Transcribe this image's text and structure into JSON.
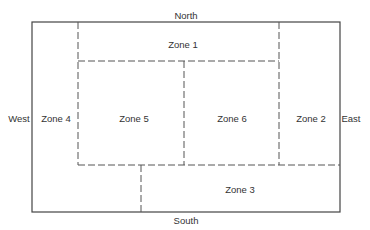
{
  "diagram": {
    "compass": {
      "north": "North",
      "south": "South",
      "east": "East",
      "west": "West"
    },
    "zones": [
      {
        "id": 1,
        "label": "Zone 1"
      },
      {
        "id": 2,
        "label": "Zone 2"
      },
      {
        "id": 3,
        "label": "Zone 3"
      },
      {
        "id": 4,
        "label": "Zone 4"
      },
      {
        "id": 5,
        "label": "Zone 5"
      },
      {
        "id": 6,
        "label": "Zone 6"
      }
    ],
    "colors": {
      "line": "#444444",
      "text": "#333333",
      "background": "#ffffff"
    }
  }
}
